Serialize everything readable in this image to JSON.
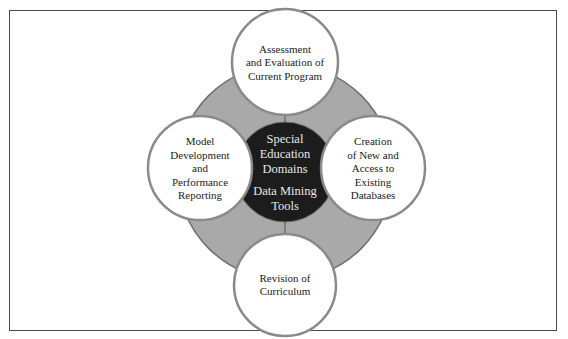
{
  "diagram": {
    "type": "hub-and-spoke",
    "colors": {
      "frame": "#4a4a4a",
      "ring_fill": "#a9a9a9",
      "ring_stroke": "#6e6e6e",
      "hub_fill": "#1c1c1c",
      "hub_text": "#e6e6e6",
      "node_fill": "#ffffff",
      "node_stroke": "#8a8a8a",
      "node_text": "#222222"
    },
    "hub": {
      "lines": [
        "Special",
        "Education",
        "Domains",
        "",
        "Data Mining",
        "Tools"
      ]
    },
    "nodes": [
      {
        "position": "top",
        "lines": [
          "Assessment",
          "and Evaluation of",
          "Current Program"
        ]
      },
      {
        "position": "left",
        "lines": [
          "Model",
          "Development",
          "and",
          "Performance",
          "Reporting"
        ]
      },
      {
        "position": "right",
        "lines": [
          "Creation",
          "of New and",
          "Access to",
          "Existing",
          "Databases"
        ]
      },
      {
        "position": "bottom",
        "lines": [
          "Revision of",
          "Curriculum"
        ]
      }
    ]
  }
}
